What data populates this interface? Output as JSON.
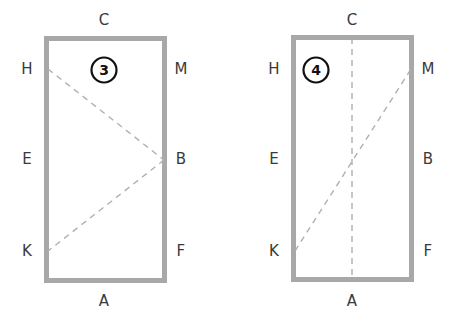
{
  "canvas": {
    "width": 460,
    "height": 330,
    "background": "#ffffff"
  },
  "style": {
    "frame_color": "#a8a8a8",
    "frame_thickness": 5,
    "dash_color": "#b0b0b0",
    "dash_width": 1.4,
    "dash_pattern": "6 5",
    "label_color": "#3a3a3a",
    "badge_ring_color": "#111111",
    "badge_text_color": "#111111"
  },
  "figures": [
    {
      "id": "figure-3",
      "badge": {
        "text": "3",
        "cx": 104,
        "cy": 70,
        "r": 12.5
      },
      "rect": {
        "x": 44,
        "y": 36,
        "width": 123,
        "height": 247
      },
      "labels": [
        {
          "name": "label-c",
          "text": "C",
          "x": 104,
          "y": 20
        },
        {
          "name": "label-h",
          "text": "H",
          "x": 27,
          "y": 69
        },
        {
          "name": "label-m",
          "text": "M",
          "x": 181,
          "y": 69
        },
        {
          "name": "label-e",
          "text": "E",
          "x": 27,
          "y": 159
        },
        {
          "name": "label-b",
          "text": "B",
          "x": 181,
          "y": 159
        },
        {
          "name": "label-k",
          "text": "K",
          "x": 27,
          "y": 251
        },
        {
          "name": "label-f",
          "text": "F",
          "x": 181,
          "y": 251
        },
        {
          "name": "label-a",
          "text": "A",
          "x": 104,
          "y": 301
        }
      ],
      "fold_lines": [
        {
          "name": "fold-line-h-b",
          "x1": 48,
          "y1": 69,
          "x2": 164,
          "y2": 160
        },
        {
          "name": "fold-line-b-k",
          "x1": 164,
          "y1": 160,
          "x2": 48,
          "y2": 251
        }
      ]
    },
    {
      "id": "figure-4",
      "badge": {
        "text": "4",
        "cx": 316,
        "cy": 70,
        "r": 12.5
      },
      "rect": {
        "x": 291,
        "y": 35,
        "width": 123,
        "height": 247
      },
      "labels": [
        {
          "name": "label-c",
          "text": "C",
          "x": 352,
          "y": 20
        },
        {
          "name": "label-h",
          "text": "H",
          "x": 274,
          "y": 69
        },
        {
          "name": "label-m",
          "text": "M",
          "x": 428,
          "y": 69
        },
        {
          "name": "label-e",
          "text": "E",
          "x": 274,
          "y": 159
        },
        {
          "name": "label-b",
          "text": "B",
          "x": 428,
          "y": 159
        },
        {
          "name": "label-k",
          "text": "K",
          "x": 274,
          "y": 251
        },
        {
          "name": "label-f",
          "text": "F",
          "x": 428,
          "y": 251
        },
        {
          "name": "label-a",
          "text": "A",
          "x": 352,
          "y": 301
        }
      ],
      "fold_lines": [
        {
          "name": "fold-line-c-a",
          "x1": 352,
          "y1": 38,
          "x2": 352,
          "y2": 280
        },
        {
          "name": "fold-line-k-m",
          "x1": 295,
          "y1": 251,
          "x2": 411,
          "y2": 69
        }
      ]
    }
  ]
}
